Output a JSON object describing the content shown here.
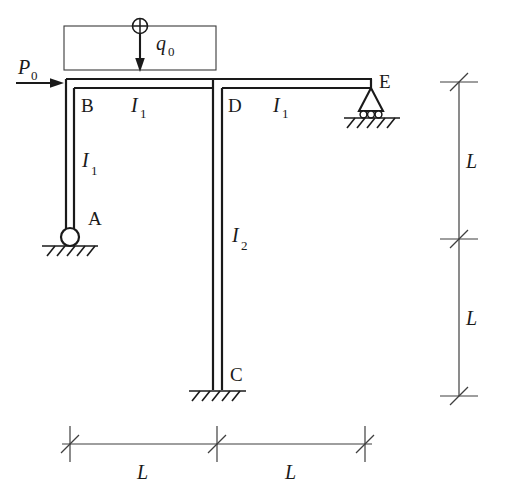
{
  "figure": {
    "background_color": "#ffffff",
    "line_color": "#1a1a1a"
  },
  "loads": {
    "distributed": {
      "symbol": "q",
      "subscript": "0",
      "direction": "downward",
      "applied_to": "beam B-D",
      "marker": "circled-plus"
    },
    "point": {
      "symbol": "P",
      "subscript": "0",
      "direction": "rightward",
      "applied_to": "joint B"
    }
  },
  "joints": [
    {
      "id": "joint-b",
      "label": "B"
    },
    {
      "id": "joint-d",
      "label": "D"
    },
    {
      "id": "joint-e",
      "label": "E"
    },
    {
      "id": "joint-a",
      "label": "A"
    },
    {
      "id": "joint-c",
      "label": "C"
    }
  ],
  "members": [
    {
      "id": "member-ab",
      "label": "I",
      "subscript": "1",
      "orientation": "vertical"
    },
    {
      "id": "member-bd",
      "label": "I",
      "subscript": "1",
      "orientation": "horizontal"
    },
    {
      "id": "member-de",
      "label": "I",
      "subscript": "1",
      "orientation": "horizontal"
    },
    {
      "id": "member-dc",
      "label": "I",
      "subscript": "2",
      "orientation": "vertical"
    }
  ],
  "supports": [
    {
      "id": "support-a",
      "type": "pin",
      "at": "A"
    },
    {
      "id": "support-c",
      "type": "fixed",
      "at": "C"
    },
    {
      "id": "support-e",
      "type": "roller",
      "at": "E"
    }
  ],
  "dimensions": {
    "horizontal": [
      {
        "id": "dim-h-left",
        "label": "L"
      },
      {
        "id": "dim-h-right",
        "label": "L"
      }
    ],
    "vertical": [
      {
        "id": "dim-v-top",
        "label": "L"
      },
      {
        "id": "dim-v-bottom",
        "label": "L"
      }
    ]
  }
}
